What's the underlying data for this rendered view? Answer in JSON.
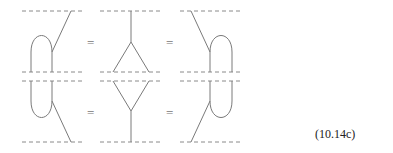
{
  "diagram": {
    "equation_label": "(10.14c)",
    "rows": [
      {
        "name": "top-row",
        "panels": [
          "cup-left-merge",
          "comultiplication-split",
          "cup-right-merge"
        ],
        "separators": [
          "=",
          "="
        ]
      },
      {
        "name": "bottom-row",
        "panels": [
          "cap-left-split",
          "multiplication-merge",
          "cap-right-split"
        ],
        "separators": [
          "=",
          "="
        ]
      }
    ],
    "colors": {
      "line": "#7a7a7a",
      "dashed": "#8a8a8a",
      "text": "#222222"
    }
  }
}
